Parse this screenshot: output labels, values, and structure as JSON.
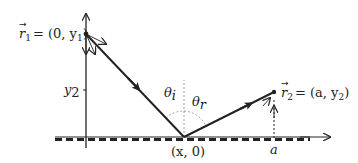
{
  "diagram": {
    "points": {
      "r1": {
        "label": "r⃗₁ = (0, y₁)",
        "name_text": "r",
        "sub": "1",
        "rhs": "= (0, y",
        "rhs_sub": "1",
        "rhs_end": ")"
      },
      "r2": {
        "label": "r⃗₂ = (a, y₂)",
        "name_text": "r",
        "sub": "2",
        "rhs": "= (a, y",
        "rhs_sub": "2",
        "rhs_end": ")"
      },
      "reflect": {
        "label": "(x, 0)"
      }
    },
    "axis_labels": {
      "y2": "y",
      "y2_sub": "2",
      "a": "a"
    },
    "angles": {
      "incident": "θ",
      "incident_sub": "i",
      "reflected": "θ",
      "reflected_sub": "r"
    },
    "colors": {
      "ink": "#222222",
      "dashed_line": "#888888"
    }
  }
}
